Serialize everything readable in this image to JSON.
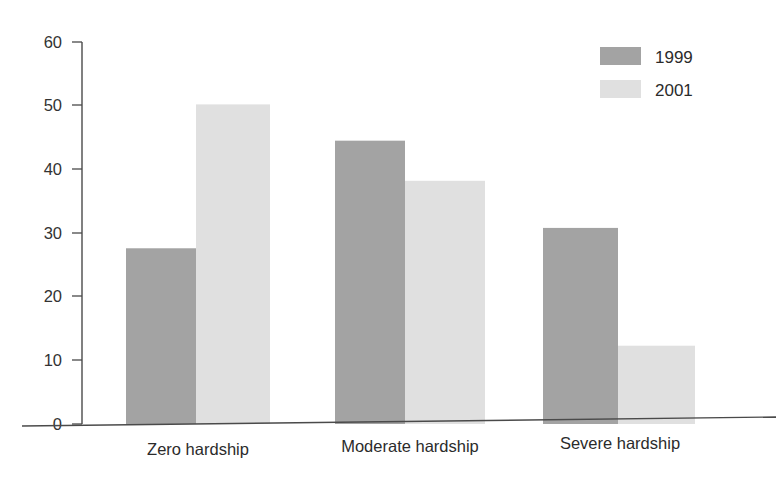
{
  "chart_data": {
    "type": "bar",
    "title": "",
    "subtitle": "",
    "xlabel": "",
    "ylabel": "",
    "categories": [
      "Zero hardship",
      "Moderate hardship",
      "Severe hardship"
    ],
    "series": [
      {
        "name": "1999",
        "values": [
          27.6,
          44.5,
          30.8
        ],
        "color": "#a3a3a3"
      },
      {
        "name": "2001",
        "values": [
          50.2,
          38.2,
          12.3
        ],
        "color": "#e0e0e0"
      }
    ],
    "ylim": [
      0,
      60
    ],
    "yticks": [
      0,
      10,
      20,
      30,
      40,
      50,
      60
    ],
    "ytick_labels": [
      "0",
      "10",
      "20",
      "30",
      "40",
      "50",
      "60"
    ],
    "grid": false,
    "legend_position": "top-right",
    "annotations": []
  },
  "axis": {
    "y_tick_labels": [
      "60",
      "50",
      "40",
      "30",
      "20",
      "10",
      "0"
    ]
  },
  "legend": {
    "entries": [
      {
        "label": "1999",
        "color": "#a3a3a3"
      },
      {
        "label": "2001",
        "color": "#e0e0e0"
      }
    ]
  },
  "colors": {
    "series_1999": "#a3a3a3",
    "series_2001": "#e0e0e0",
    "axis": "#4a4a4a",
    "text": "#2b2b2b",
    "background": "#ffffff"
  }
}
